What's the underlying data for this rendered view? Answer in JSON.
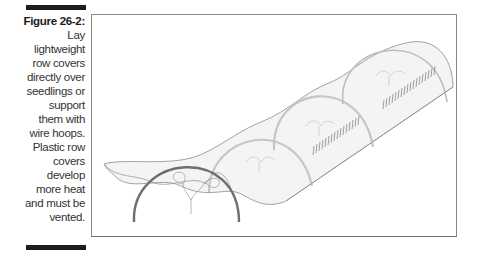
{
  "figure": {
    "label": "Figure 26-2:",
    "caption": "Lay lightweight row covers directly over seedlings or support them with wire hoops. Plastic row covers develop more heat and must be vented.",
    "caption_lines": [
      "Lay",
      "lightweight",
      "row covers",
      "directly over",
      "seedlings or",
      "support",
      "them with",
      "wire hoops.",
      "Plastic row",
      "covers",
      "develop",
      "more heat",
      "and must be",
      "vented."
    ]
  },
  "illustration": {
    "subject": "row cover tunnel over wire hoops with seedlings",
    "colors": {
      "hoop_front": "#6e6e6e",
      "hoop_covered": "#c4c4c4",
      "cover_outline": "#8c8c8c",
      "cover_fill": "#f3f3f3",
      "seedling_rows": "#777777",
      "frame": "#8a8a8a"
    }
  }
}
